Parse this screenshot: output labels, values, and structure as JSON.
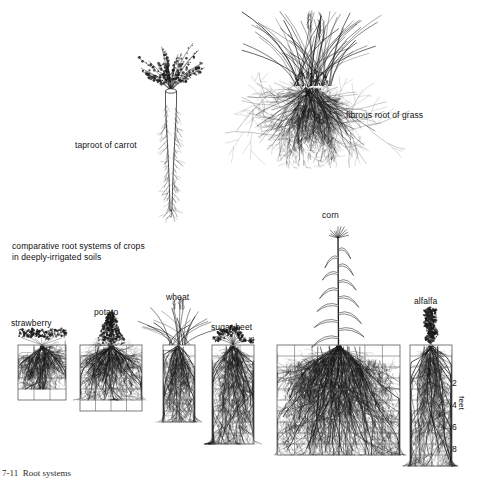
{
  "figure": {
    "background_color": "#ffffff",
    "ink_color": "#1a1a1a",
    "grid_color": "#5a5a5a",
    "caption": "7-11  Root systems"
  },
  "top_specimens": [
    {
      "id": "carrot",
      "label": "taproot of carrot",
      "root_type": "taproot",
      "label_x": 75,
      "label_y": 140,
      "plant_x": 145,
      "plant_y": 33,
      "plant_w": 52,
      "plant_h": 182
    },
    {
      "id": "grass",
      "label": "fibrous root of grass",
      "root_type": "fibrous",
      "label_x": 346,
      "label_y": 110,
      "plant_x": 272,
      "plant_y": 8,
      "plant_w": 78,
      "plant_h": 160
    }
  ],
  "comparative": {
    "heading_line_1": "comparative root systems of crops",
    "heading_line_2": "in deeply-irrigated soils",
    "heading_x": 12,
    "heading_y": 241,
    "scale": {
      "axis_title": "feet",
      "axis_title_x": 466,
      "axis_title_y": 396,
      "tick_values": [
        "2",
        "4",
        "6",
        "8"
      ],
      "tick_x": 452,
      "tick_ys": [
        378,
        400,
        422,
        444
      ],
      "row_height_px": 11,
      "feet_per_row": 1
    },
    "crops": [
      {
        "id": "strawberry",
        "label": "strawberry",
        "label_x": 11,
        "label_y": 318,
        "grid_x": 18,
        "grid_y": 345,
        "grid_w": 48,
        "grid_h": 55,
        "cols": 3,
        "rows": 5,
        "root_depth_rows": 4,
        "root_spread": 0.92,
        "top_style": "rosette",
        "top_h": 22
      },
      {
        "id": "potato",
        "label": "potato",
        "label_x": 94,
        "label_y": 307,
        "grid_x": 80,
        "grid_y": 345,
        "grid_w": 62,
        "grid_h": 66,
        "cols": 4,
        "rows": 6,
        "root_depth_rows": 5,
        "root_spread": 0.95,
        "top_style": "bush",
        "top_h": 34
      },
      {
        "id": "wheat",
        "label": "wheat",
        "label_x": 166,
        "label_y": 292,
        "grid_x": 163,
        "grid_y": 345,
        "grid_w": 32,
        "grid_h": 77,
        "cols": 2,
        "rows": 7,
        "root_depth_rows": 7,
        "root_spread": 0.85,
        "top_style": "grass",
        "top_h": 46
      },
      {
        "id": "sugar-beet",
        "label": "sugar beet",
        "label_x": 211,
        "label_y": 322,
        "grid_x": 212,
        "grid_y": 345,
        "grid_w": 42,
        "grid_h": 99,
        "cols": 3,
        "rows": 9,
        "root_depth_rows": 9,
        "root_spread": 0.8,
        "top_style": "beet",
        "top_h": 20
      },
      {
        "id": "corn",
        "label": "corn",
        "label_x": 322,
        "label_y": 210,
        "grid_x": 277,
        "grid_y": 345,
        "grid_w": 123,
        "grid_h": 110,
        "cols": 7,
        "rows": 10,
        "root_depth_rows": 10,
        "root_spread": 1.0,
        "top_style": "maize",
        "top_h": 122
      },
      {
        "id": "alfalfa",
        "label": "alfalfa",
        "label_x": 414,
        "label_y": 296,
        "grid_x": 410,
        "grid_y": 345,
        "grid_w": 42,
        "grid_h": 121,
        "cols": 3,
        "rows": 11,
        "root_depth_rows": 11,
        "root_spread": 0.75,
        "top_style": "leafy",
        "top_h": 38
      }
    ]
  }
}
